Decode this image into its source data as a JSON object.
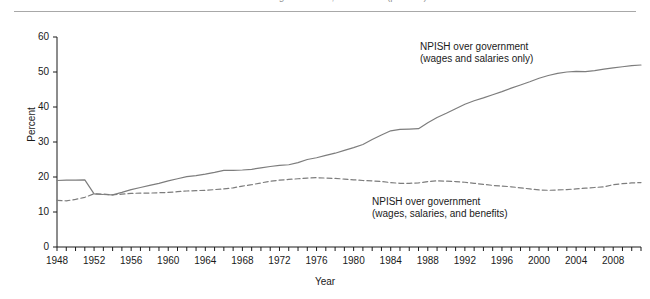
{
  "figure": {
    "cropped_title": "NPISH over government, 1948-2011 (percent)",
    "ylabel": "Percent",
    "xlabel": "Year",
    "line_color": "#7d7d7d",
    "axis_color": "#1a1a1a"
  },
  "annotations": {
    "solid": {
      "line1": "NPISH over government",
      "line2": "(wages and salaries only)"
    },
    "dashed": {
      "line1": "NPISH over government",
      "line2": "(wages, salaries, and benefits)"
    }
  },
  "chart_data": {
    "type": "line",
    "title": "NPISH over government, 1948-2011 (percent)",
    "xlabel": "Year",
    "ylabel": "Percent",
    "xlim": [
      1948,
      2011
    ],
    "ylim": [
      0,
      60
    ],
    "yticks": [
      0,
      10,
      20,
      30,
      40,
      50,
      60
    ],
    "xticks": [
      1948,
      1952,
      1956,
      1960,
      1964,
      1968,
      1972,
      1976,
      1980,
      1984,
      1988,
      1992,
      1996,
      2000,
      2004,
      2008
    ],
    "xtick_minor_step": 1,
    "grid": false,
    "legend": "inline-annotations",
    "x": [
      1948,
      1949,
      1950,
      1951,
      1952,
      1953,
      1954,
      1955,
      1956,
      1957,
      1958,
      1959,
      1960,
      1961,
      1962,
      1963,
      1964,
      1965,
      1966,
      1967,
      1968,
      1969,
      1970,
      1971,
      1972,
      1973,
      1974,
      1975,
      1976,
      1977,
      1978,
      1979,
      1980,
      1981,
      1982,
      1983,
      1984,
      1985,
      1986,
      1987,
      1988,
      1989,
      1990,
      1991,
      1992,
      1993,
      1994,
      1995,
      1996,
      1997,
      1998,
      1999,
      2000,
      2001,
      2002,
      2003,
      2004,
      2005,
      2006,
      2007,
      2008,
      2009,
      2010,
      2011
    ],
    "series": [
      {
        "name": "NPISH over government (wages and salaries only)",
        "style": "solid",
        "color": "#7d7d7d",
        "values": [
          19.0,
          19.1,
          19.1,
          19.2,
          15.2,
          15.0,
          14.9,
          15.6,
          16.4,
          17.0,
          17.6,
          18.2,
          18.9,
          19.5,
          20.1,
          20.4,
          20.8,
          21.3,
          21.9,
          21.9,
          22.0,
          22.2,
          22.6,
          23.0,
          23.3,
          23.5,
          24.1,
          25.0,
          25.5,
          26.2,
          26.8,
          27.6,
          28.4,
          29.3,
          30.7,
          32.0,
          33.2,
          33.6,
          33.7,
          33.8,
          35.5,
          37.0,
          38.2,
          39.5,
          40.8,
          41.8,
          42.6,
          43.5,
          44.4,
          45.4,
          46.3,
          47.2,
          48.2,
          49.0,
          49.6,
          50.0,
          50.2,
          50.1,
          50.4,
          50.8,
          51.2,
          51.5,
          51.8,
          52.0
        ]
      },
      {
        "name": "NPISH over government (wages, salaries, and benefits)",
        "style": "dashed",
        "color": "#7d7d7d",
        "values": [
          13.3,
          13.2,
          13.6,
          14.2,
          15.2,
          15.1,
          14.9,
          15.1,
          15.3,
          15.4,
          15.4,
          15.5,
          15.6,
          15.8,
          16.0,
          16.1,
          16.2,
          16.4,
          16.6,
          16.9,
          17.4,
          17.8,
          18.3,
          18.8,
          19.1,
          19.3,
          19.5,
          19.7,
          19.8,
          19.7,
          19.6,
          19.4,
          19.2,
          19.0,
          18.9,
          18.7,
          18.4,
          18.2,
          18.2,
          18.3,
          18.7,
          18.9,
          18.8,
          18.7,
          18.5,
          18.2,
          17.9,
          17.6,
          17.4,
          17.2,
          16.9,
          16.6,
          16.3,
          16.2,
          16.3,
          16.4,
          16.6,
          16.8,
          17.0,
          17.2,
          17.8,
          18.1,
          18.3,
          18.4
        ]
      }
    ]
  }
}
